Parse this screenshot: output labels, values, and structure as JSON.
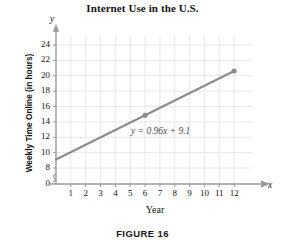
{
  "figure": {
    "title": "Internet Use in the U.S.",
    "caption": "FIGURE 16",
    "axis_symbol_x": "x",
    "axis_symbol_y": "y"
  },
  "chart_data": {
    "type": "line",
    "title": "Internet Use in the U.S.",
    "xlabel": "Year",
    "ylabel": "Weekly Time Online (in hours)",
    "equation": "y = 0.96x + 9.1",
    "slope": 0.96,
    "intercept": 9.1,
    "xlim": [
      0,
      12.8
    ],
    "ylim": [
      8,
      25
    ],
    "y_axis_break": true,
    "grid": true,
    "legend": "none",
    "x_ticks": [
      1,
      2,
      3,
      4,
      5,
      6,
      7,
      8,
      9,
      10,
      11,
      12
    ],
    "x_tick_labels": [
      "1",
      "2",
      "3",
      "4",
      "5",
      "6",
      "7",
      "8",
      "9",
      "10",
      "11",
      "12"
    ],
    "y_ticks": [
      8,
      10,
      12,
      14,
      16,
      18,
      20,
      22,
      24
    ],
    "y_tick_labels": [
      "8",
      "10",
      "12",
      "14",
      "16",
      "18",
      "20",
      "22",
      "24"
    ],
    "y_origin_label": "0",
    "line_endpoints": [
      {
        "x": 0,
        "y": 9.1
      },
      {
        "x": 12,
        "y": 20.62
      }
    ],
    "markers": [
      {
        "x": 6,
        "y": 14.86
      },
      {
        "x": 12,
        "y": 20.62
      }
    ],
    "series": [
      {
        "name": "Weekly time online",
        "x": [
          0,
          6,
          12
        ],
        "values": [
          9.1,
          14.86,
          20.62
        ]
      }
    ],
    "colors": {
      "line": "#8c8c8c",
      "marker": "#8c8c8c",
      "grid": "#e2e2e2",
      "axis": "#9a9a9a",
      "text": "#111111"
    }
  }
}
